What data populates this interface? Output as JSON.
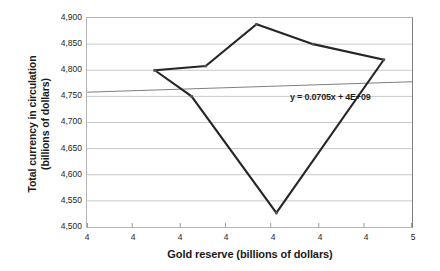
{
  "chart_data": {
    "type": "line",
    "title": "",
    "xlabel": "Gold reserve (billions of dollars)",
    "ylabel": "Total currency in circulation (billions of dollars)",
    "ylabel_lines": [
      "Total currency in circulation",
      "(billions of dollars)"
    ],
    "xlim": [
      3.9,
      5.05
    ],
    "ylim": [
      4500,
      4900
    ],
    "grid": "horizontal",
    "legend": "none",
    "y_ticks": [
      "4,500",
      "4,550",
      "4,600",
      "4,650",
      "4,700",
      "4,750",
      "4,800",
      "4,850",
      "4,900"
    ],
    "y_tick_values": [
      4500,
      4550,
      4600,
      4650,
      4700,
      4750,
      4800,
      4850,
      4900
    ],
    "x_ticks": [
      "4",
      "4",
      "4",
      "4",
      "4",
      "4",
      "4",
      "5"
    ],
    "x_tick_values": [
      3.9,
      4.06,
      4.23,
      4.39,
      4.55,
      4.72,
      4.88,
      5.05
    ],
    "series": [
      {
        "name": "Gold reserve vs currency in circulation",
        "color": "#262626",
        "points": [
          {
            "x": 4.14,
            "y": 4800
          },
          {
            "x": 4.27,
            "y": 4750
          },
          {
            "x": 4.57,
            "y": 4527
          },
          {
            "x": 4.95,
            "y": 4820
          },
          {
            "x": 4.7,
            "y": 4850
          },
          {
            "x": 4.5,
            "y": 4888
          },
          {
            "x": 4.32,
            "y": 4808
          },
          {
            "x": 4.14,
            "y": 4800
          }
        ]
      }
    ],
    "trendline": {
      "equation": "y = 0.0705x + 4E+09",
      "color": "#808080",
      "y_start": 4758,
      "y_end": 4778
    }
  }
}
